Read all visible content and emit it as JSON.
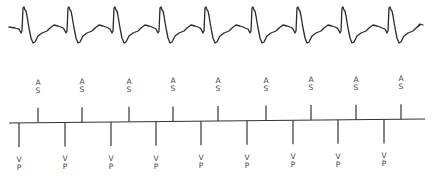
{
  "figure": {
    "ecg": {
      "beat_spike_x": [
        23,
        68,
        114,
        160,
        205,
        252,
        297,
        342,
        389
      ],
      "start_x": 9,
      "end_x": 423,
      "color": "#2a2a2a"
    },
    "marker_channel": {
      "baseline": {
        "x_start": 9,
        "y_start": 123,
        "x_end": 425,
        "y_end": 119
      },
      "atrial_markers": {
        "label_line1": "A",
        "label_line2": "S",
        "x": [
          38,
          82,
          129,
          173,
          218,
          266,
          311,
          356,
          401
        ]
      },
      "ventricular_markers": {
        "label_line1": "V",
        "label_line2": "P",
        "x": [
          19,
          65,
          111,
          156,
          201,
          247,
          293,
          338,
          384
        ]
      }
    }
  }
}
